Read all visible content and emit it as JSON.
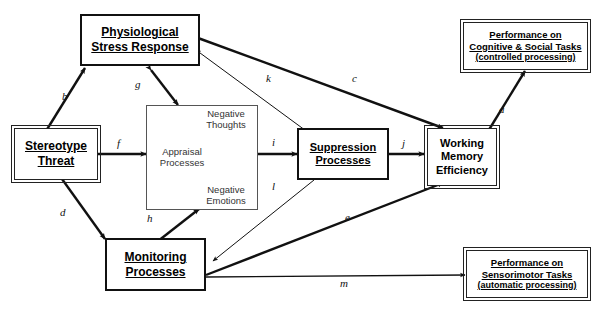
{
  "diagram": {
    "artifact_text": "",
    "nodes": {
      "physiological": {
        "line1": "Physiological",
        "line2": "Stress Response"
      },
      "stereotype": {
        "line1": "Stereotype",
        "line2": "Threat"
      },
      "monitoring": {
        "line1": "Monitoring",
        "line2": "Processes"
      },
      "suppression": {
        "line1": "Suppression",
        "line2": "Processes"
      },
      "working_memory": {
        "line1": "Working",
        "line2": "Memory",
        "line3": "Efficiency"
      },
      "cognitive_tasks": {
        "line1": "Performance on",
        "line2": "Cognitive & Social Tasks",
        "line3": "(controlled processing)"
      },
      "sensorimotor_tasks": {
        "line1": "Performance on",
        "line2": "Sensorimotor Tasks",
        "line3": "(automatic processing)"
      },
      "appraisal": {
        "center_line1": "Appraisal",
        "center_line2": "Processes",
        "thoughts_line1": "Negative",
        "thoughts_line2": "Thoughts",
        "emotions_line1": "Negative",
        "emotions_line2": "Emotions"
      }
    },
    "edge_labels": {
      "a": "a",
      "b": "b",
      "c": "c",
      "d": "d",
      "e": "e",
      "f": "f",
      "g": "g",
      "h": "h",
      "i": "i",
      "j": "j",
      "k": "k",
      "l": "l",
      "m": "m"
    },
    "colors": {
      "stroke": "#111111",
      "background": "#ffffff",
      "text": "#000000",
      "inner_stroke": "#555555"
    }
  }
}
